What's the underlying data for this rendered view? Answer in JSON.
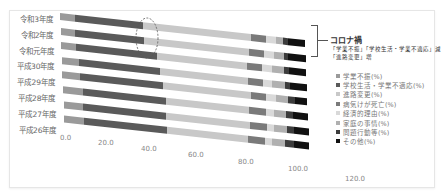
{
  "chart_data": {
    "type": "bar",
    "orientation": "horizontal",
    "stacked": true,
    "categories": [
      "令和3年度",
      "令和2年度",
      "令和元年度",
      "平成30年度",
      "平成29年度",
      "平成28年度",
      "平成27年度",
      "平成26年度"
    ],
    "series": [
      {
        "name": "学業不振(%)",
        "color": "#9a9a9a",
        "values": [
          6,
          6,
          6,
          7,
          7,
          8,
          8,
          8
        ]
      },
      {
        "name": "学校生活・学業不適応(%)",
        "color": "#5a5a5a",
        "values": [
          28,
          28,
          33,
          33,
          34,
          34,
          34,
          34
        ]
      },
      {
        "name": "進路変更(%)",
        "color": "#c8c8c8",
        "values": [
          44,
          43,
          37,
          36,
          36,
          34,
          34,
          33
        ]
      },
      {
        "name": "病気けが死亡(%)",
        "color": "#7a7a7a",
        "values": [
          6,
          6,
          6,
          6,
          6,
          7,
          7,
          7
        ]
      },
      {
        "name": "経済的理由(%)",
        "color": "#d9d9d9",
        "values": [
          4,
          4,
          4,
          4,
          4,
          3,
          3,
          3
        ]
      },
      {
        "name": "家庭の事情(%)",
        "color": "#b0b0b0",
        "values": [
          3,
          4,
          5,
          5,
          5,
          5,
          5,
          5
        ]
      },
      {
        "name": "問題行動等(%)",
        "color": "#3c3c3c",
        "values": [
          2,
          2,
          2,
          2,
          3,
          3,
          3,
          4
        ]
      },
      {
        "name": "その他(%)",
        "color": "#111111",
        "values": [
          7,
          7,
          7,
          7,
          5,
          6,
          6,
          6
        ]
      }
    ],
    "xticks": [
      "0.0",
      "20.0",
      "40.0",
      "60.0",
      "80.0",
      "100.0",
      "120.0"
    ],
    "xlim": [
      0,
      120
    ],
    "title": "",
    "xlabel": "",
    "ylabel": "",
    "grid": false,
    "legend_position": "right",
    "annotation": {
      "title": "コロナ禍",
      "lines": [
        "「学業不振」「学校生活・学業不適応」減",
        "「進路変更」増"
      ],
      "highlight": "dashed ellipse around 令和3年度 and 令和2年度 near 40%"
    }
  }
}
